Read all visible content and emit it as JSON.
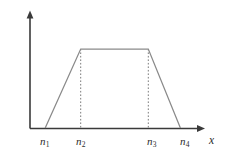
{
  "chart_data": {
    "type": "line",
    "title": "",
    "subtitle": "",
    "xlabel": "x",
    "ylabel": "μ",
    "ylabel_subscript_base": "A",
    "ylabel_subscript_accent": "~",
    "ylabel_argument": "(x)",
    "ylabel_full": "μÃ(x)",
    "grid": false,
    "legend": null,
    "legend_position": "none",
    "xlim": [
      0,
      1
    ],
    "ylim": [
      0,
      1
    ],
    "axis_ticks_shown": false,
    "series": [
      {
        "name": "trapezoidal-membership-function",
        "color": "#8a8a8a",
        "x": [
          0.09,
          0.3,
          0.7,
          0.89
        ],
        "y": [
          0.0,
          1.0,
          1.0,
          0.0
        ],
        "x_labels": [
          "n1",
          "n2",
          "n3",
          "n4"
        ],
        "y_labels": [
          "0",
          "1",
          "1",
          "0"
        ]
      }
    ],
    "guides": [
      {
        "name": "guide-n2",
        "x": 0.3,
        "from_y": 0.0,
        "to_y": 1.0,
        "style": "dashed"
      },
      {
        "name": "guide-n3",
        "x": 0.7,
        "from_y": 0.0,
        "to_y": 1.0,
        "style": "dashed"
      }
    ],
    "tick_labels": [
      {
        "id": "n1",
        "base": "n",
        "sub": "1"
      },
      {
        "id": "n2",
        "base": "n",
        "sub": "2"
      },
      {
        "id": "n3",
        "base": "n",
        "sub": "3"
      },
      {
        "id": "n4",
        "base": "n",
        "sub": "4"
      }
    ],
    "colors": {
      "axis": "#3a3a3a",
      "curve": "#8a8a8a",
      "guide": "#7c7c7c",
      "background": "#ffffff",
      "text": "#2b2b2b"
    }
  },
  "axis_titles": {
    "x": "x",
    "y_mu": "μ",
    "y_sub_base": "A",
    "y_sub_accent": "˜",
    "y_arg": "(x)"
  },
  "ticks": {
    "n1": {
      "base": "n",
      "sub": "1"
    },
    "n2": {
      "base": "n",
      "sub": "2"
    },
    "n3": {
      "base": "n",
      "sub": "3"
    },
    "n4": {
      "base": "n",
      "sub": "4"
    }
  }
}
